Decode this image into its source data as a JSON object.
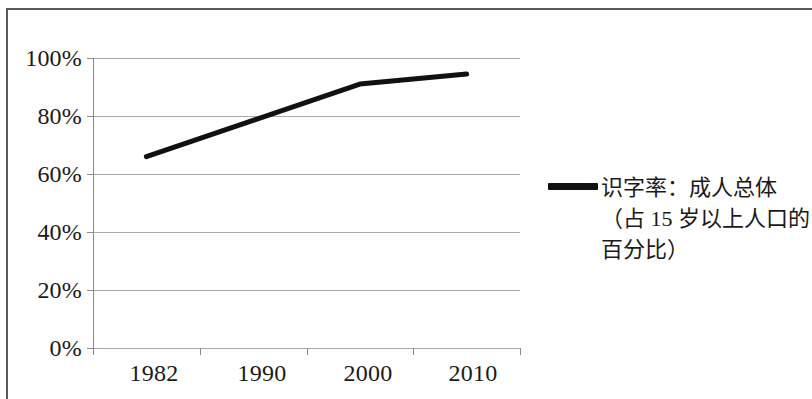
{
  "chart_data": {
    "type": "line",
    "title": "",
    "subtitle": "",
    "xlabel": "",
    "ylabel": "",
    "categories": [
      "1982",
      "1990",
      "2000",
      "2010"
    ],
    "x": [
      1982,
      1990,
      2000,
      2010
    ],
    "series": [
      {
        "name": "识字率：成人总体（占 15 岁以上人口的百分比）",
        "values": [
          66,
          78.5,
          91,
          94.5
        ],
        "color": "#111111",
        "line_width": 5
      }
    ],
    "xlim": [
      1978,
      2014
    ],
    "ylim": [
      0,
      100
    ],
    "y_ticks": [
      0,
      20,
      40,
      60,
      80,
      100
    ],
    "y_tick_labels": [
      "0%",
      "20%",
      "40%",
      "60%",
      "80%",
      "100%"
    ],
    "x_tick_labels": [
      "1982",
      "1990",
      "2000",
      "2010"
    ],
    "grid": "horizontal",
    "grid_color": "#a9a9a9",
    "legend_position": "right",
    "legend_entries": [
      {
        "label_lines": [
          "识字率：成人总体",
          "（占 15 岁以上人口的",
          "百分比）"
        ],
        "marker": "line",
        "color": "#111111"
      }
    ],
    "axis_color": "#8a8a8a",
    "background": "#ffffff"
  },
  "frame": {
    "border_color": "#555b60"
  },
  "axes": {
    "y_labels": [
      "100%",
      "80%",
      "60%",
      "40%",
      "20%",
      "0%"
    ],
    "x_labels": [
      "1982",
      "1990",
      "2000",
      "2010"
    ]
  },
  "legend": {
    "line1": "识字率：成人总体",
    "line2": "（占 15 岁以上人口的",
    "line3": "百分比）"
  }
}
